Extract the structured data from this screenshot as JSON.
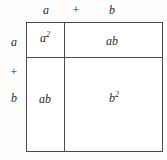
{
  "figure": {
    "ink_color": "#4a4a4a",
    "text_color": "#2b2b2b",
    "background_color": "#ffffff"
  },
  "top_labels": {
    "first": "a",
    "operator": "+",
    "second": "b"
  },
  "left_labels": {
    "first": "a",
    "operator": "+",
    "second": "b"
  },
  "cells": {
    "top_left": {
      "base": "a",
      "exponent": "2"
    },
    "top_right": {
      "base": "ab",
      "exponent": ""
    },
    "bottom_left": {
      "base": "ab",
      "exponent": ""
    },
    "bottom_right": {
      "base": "b",
      "exponent": "2"
    }
  }
}
